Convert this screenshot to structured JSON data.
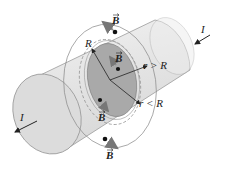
{
  "figure": {
    "labels": {
      "current_right": "I",
      "current_left": "I",
      "radius": "R",
      "outside_radius": "r > R",
      "inside_radius": "r < R",
      "field_top": "B",
      "field_inner_top": "B",
      "field_inner_bottom": "B",
      "field_bottom": "B"
    },
    "colors": {
      "cylinder_fill": "#e6e6e6",
      "cylinder_edge": "#9a9a9a",
      "cross_section": "#a8a8a8",
      "field_line": "#808080",
      "arrow": "#222222"
    }
  }
}
